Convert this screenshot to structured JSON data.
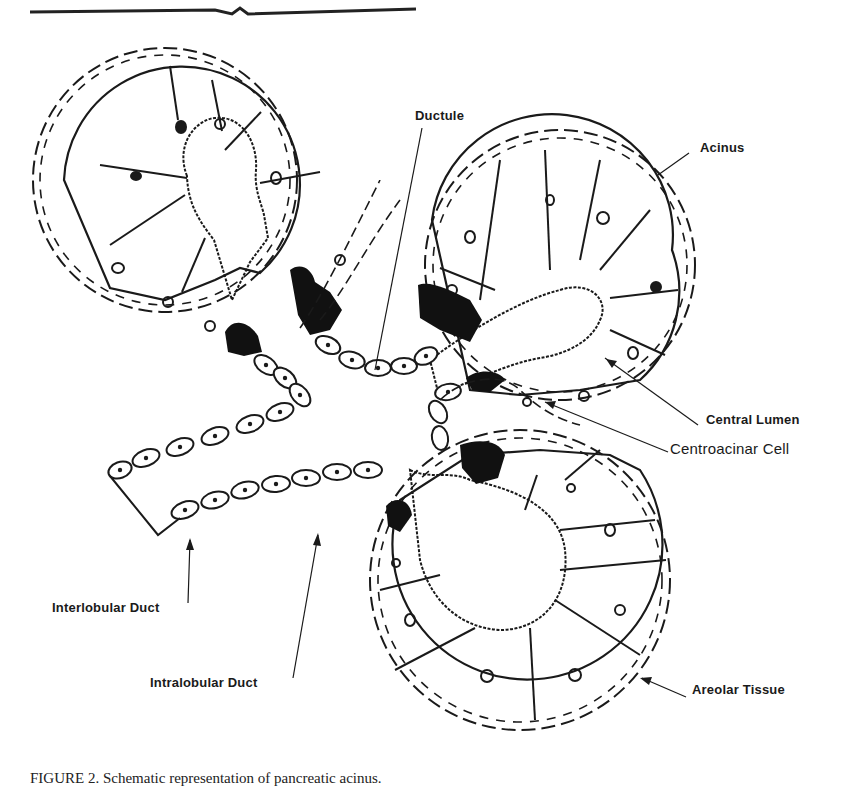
{
  "figure": {
    "title": "Schematic representation of pancreatic acinus",
    "labels": {
      "ductule": "Ductule",
      "acinus": "Acinus",
      "central_lumen": "Central Lumen",
      "centroacinar_cell": "Centroacinar Cell",
      "interlobular_duct": "Interlobular Duct",
      "intralobular_duct": "Intralobular Duct",
      "areolar_tissue": "Areolar Tissue"
    },
    "caption": "FIGURE 2.   Schematic representation of pancreatic acinus."
  },
  "colors": {
    "ink": "#1a1a1a",
    "background": "#ffffff"
  }
}
